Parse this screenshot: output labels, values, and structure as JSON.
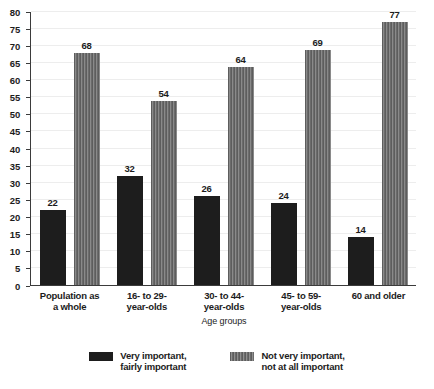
{
  "chart_data": {
    "type": "bar",
    "title": "",
    "subtitle": "",
    "xlabel": "Age groups",
    "ylabel": "",
    "ylim": [
      0,
      80
    ],
    "ytick_step": 5,
    "yticks": [
      0,
      5,
      10,
      15,
      20,
      25,
      30,
      35,
      40,
      45,
      50,
      55,
      60,
      65,
      70,
      75,
      80
    ],
    "grid": true,
    "grid_orientation": "horizontal",
    "legend_position": "bottom",
    "categories": [
      "Population as\na whole",
      "16- to 29-\nyear-olds",
      "30- to 44-\nyear-olds",
      "45- to 59-\nyear-olds",
      "60 and older"
    ],
    "series": [
      {
        "name": "Very important,\nfairly important",
        "color": "#1d1d1d",
        "pattern": "solid",
        "values": [
          22,
          32,
          26,
          24,
          14
        ]
      },
      {
        "name": "Not very important,\nnot at all important",
        "color": "#6f6f6f",
        "pattern": "vertical-stripes",
        "values": [
          68,
          54,
          64,
          69,
          77
        ]
      }
    ]
  },
  "colors": {
    "background": "#ffffff",
    "axis": "#3b3b3b",
    "gridline": "#ededed",
    "text": "#1c1c1c",
    "series_0": "#1d1d1d",
    "series_1": "#6f6f6f"
  }
}
